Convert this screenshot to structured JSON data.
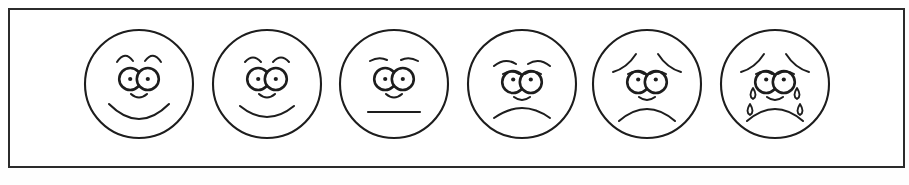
{
  "image": {
    "title": "Six-point facial expression rating scale",
    "background_color": "#fefefe",
    "border_color": "#2b2b2b",
    "ink_color": "#1d1d1d",
    "face_fill": "#ffffff"
  },
  "scale": {
    "name": "faces-pain-rating-scale",
    "orientation": "horizontal",
    "count": 6,
    "faces": [
      {
        "index": 1,
        "name": "face-very-happy",
        "expression": "very happy",
        "mouth": "wide-smile",
        "brows": "high-arched",
        "nose": "curved",
        "tears": false
      },
      {
        "index": 2,
        "name": "face-happy",
        "expression": "happy",
        "mouth": "smile",
        "brows": "arched",
        "nose": "curved",
        "tears": false
      },
      {
        "index": 3,
        "name": "face-neutral",
        "expression": "neutral",
        "mouth": "straight-line",
        "brows": "flat-separated",
        "nose": "curved",
        "tears": false
      },
      {
        "index": 4,
        "name": "face-slightly-sad",
        "expression": "slightly sad",
        "mouth": "slight-frown",
        "brows": "drooping",
        "nose": "curved",
        "tears": false
      },
      {
        "index": 5,
        "name": "face-sad",
        "expression": "sad",
        "mouth": "frown",
        "brows": "worried-sloped",
        "nose": "curved",
        "tears": false
      },
      {
        "index": 6,
        "name": "face-crying",
        "expression": "crying",
        "mouth": "deep-frown",
        "brows": "worried-sloped",
        "nose": "curved",
        "tears": true,
        "tear_count": 4
      }
    ]
  }
}
